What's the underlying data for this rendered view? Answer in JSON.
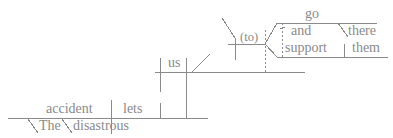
{
  "diagram": {
    "type": "reed-kellogg-sentence-diagram",
    "sentence": "The disastrous accident lets us go there and support them.",
    "ink_color": "#8a8a8a",
    "background": "#ffffff",
    "words": {
      "subject": "accident",
      "article": "The",
      "adjective": "disastrous",
      "main_verb": "lets",
      "object": "us",
      "infinitive_marker": "(to)",
      "verb_one": "go",
      "adverb": "there",
      "conjunction": "and",
      "verb_two": "support",
      "object_two": "them"
    }
  }
}
